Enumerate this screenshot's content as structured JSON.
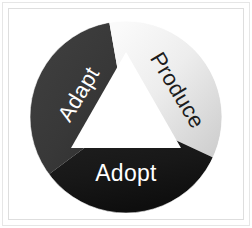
{
  "figure": {
    "type": "three-segment-ring-diagram",
    "background_color": "#ffffff",
    "frame_color": "#e3e3e3",
    "center_shape": "triangle",
    "center_color": "#ffffff"
  },
  "segments": [
    {
      "id": "adapt",
      "label": "Adapt",
      "position": "upper-left",
      "fill_color": "#3a3a3a",
      "fill_color_edge": "#2d2d2d",
      "text_color": "#ffffff",
      "rotation_deg": -59
    },
    {
      "id": "produce",
      "label": "Produce",
      "position": "upper-right",
      "fill_color": "#f4f4f4",
      "fill_color_edge": "#d2d2d2",
      "text_color": "#1c1c1c",
      "rotation_deg": 59
    },
    {
      "id": "adopt",
      "label": "Adopt",
      "position": "bottom",
      "fill_color": "#1a1a1a",
      "fill_color_edge": "#0d0d0d",
      "text_color": "#ffffff",
      "rotation_deg": 0
    }
  ]
}
